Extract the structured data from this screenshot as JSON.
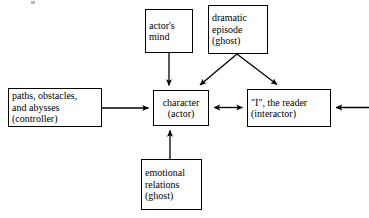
{
  "diagram": {
    "background_color": "#ffffff",
    "stroke_color": "#000000",
    "nodes": [
      {
        "id": "actors-mind",
        "lines": [
          "actor's",
          "mind"
        ],
        "align": "left"
      },
      {
        "id": "dramatic-episode",
        "lines": [
          "dramatic",
          "episode",
          "(ghost)"
        ],
        "align": "left"
      },
      {
        "id": "paths-obstacles",
        "lines": [
          "paths, obstacles,",
          "and abysses",
          "(controller)"
        ],
        "align": "left"
      },
      {
        "id": "character-actor",
        "lines": [
          "character",
          "(actor)"
        ],
        "align": "center"
      },
      {
        "id": "reader-interactor",
        "lines": [
          "\"I\", the reader",
          "(interactor)"
        ],
        "align": "left"
      },
      {
        "id": "emotional-relations",
        "lines": [
          "emotional",
          "relations",
          "(ghost)"
        ],
        "align": "left"
      }
    ],
    "edges": [
      {
        "id": "actors-mind-to-character",
        "from": "actors-mind",
        "to": "character-actor",
        "arrowheads": "end",
        "direction": "down"
      },
      {
        "id": "dramatic-episode-to-character",
        "from": "dramatic-episode",
        "to": "character-actor",
        "arrowheads": "end",
        "direction": "diagonal-down-left"
      },
      {
        "id": "dramatic-episode-to-reader",
        "from": "dramatic-episode",
        "to": "reader-interactor",
        "arrowheads": "end",
        "direction": "diagonal-down-right"
      },
      {
        "id": "paths-to-character",
        "from": "paths-obstacles",
        "to": "character-actor",
        "arrowheads": "end",
        "direction": "right"
      },
      {
        "id": "character-to-reader",
        "from": "character-actor",
        "to": "reader-interactor",
        "arrowheads": "both",
        "direction": "horizontal"
      },
      {
        "id": "external-to-reader",
        "from": "outside-right-edge",
        "to": "reader-interactor",
        "arrowheads": "end",
        "direction": "left"
      },
      {
        "id": "emotional-to-character",
        "from": "emotional-relations",
        "to": "character-actor",
        "arrowheads": "end",
        "direction": "up"
      }
    ]
  }
}
